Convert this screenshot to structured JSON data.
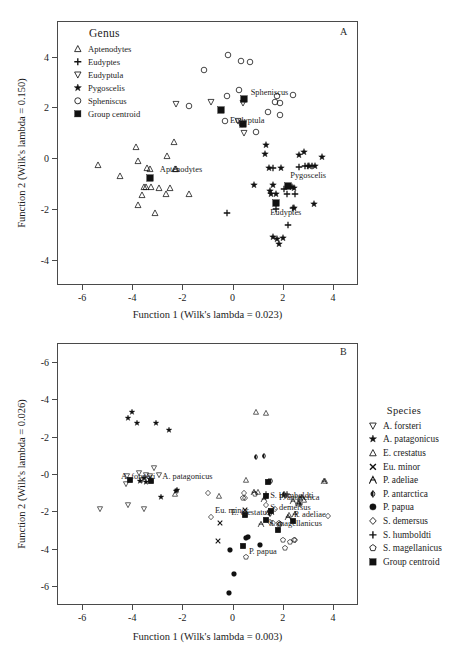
{
  "figure": {
    "panels": [
      {
        "id": "A",
        "letter": "A",
        "xlabel": "Function 1 (Wilk's lambda = 0.023)",
        "ylabel": "Function 2 (Wilk's lambda = 0.150)",
        "legend_title": "Genus"
      },
      {
        "id": "B",
        "letter": "B",
        "xlabel": "Function 1 (Wilk's lambda = 0.003)",
        "ylabel": "Function 2 (Wilk's lambda = 0.026)",
        "legend_title": "Species"
      }
    ]
  },
  "chart_data": [
    {
      "type": "scatter",
      "panel": "A",
      "title": "A",
      "xlabel": "Function 1 (Wilk's lambda = 0.023)",
      "ylabel": "Function 2 (Wilk's lambda = 0.150)",
      "xlim": [
        -7.0,
        5.0
      ],
      "ylim": [
        -5.0,
        5.4
      ],
      "xticks": [
        -6,
        -4,
        -2,
        0,
        2,
        4
      ],
      "xticklabels": [
        "-6",
        "-4",
        "-2",
        "0",
        "2",
        "4"
      ],
      "yticks": [
        -4,
        -2,
        0,
        2,
        4
      ],
      "yticklabels": [
        "-4",
        "-2",
        "0",
        "2",
        "4"
      ],
      "grid": false,
      "legend_position": "upper-left-inside",
      "legend_title": "Genus",
      "series": [
        {
          "name": "Aptenodytes",
          "marker": "triangle-up-open",
          "points": [
            [
              -5.35,
              -0.27
            ],
            [
              -4.5,
              -0.7
            ],
            [
              -3.85,
              0.42
            ],
            [
              -3.78,
              -0.1
            ],
            [
              -3.78,
              -1.86
            ],
            [
              -3.6,
              -1.44
            ],
            [
              -3.55,
              -1.12
            ],
            [
              -3.45,
              -1.12
            ],
            [
              -3.4,
              -0.4
            ],
            [
              -3.3,
              -0.42
            ],
            [
              -3.25,
              -1.15
            ],
            [
              -3.1,
              -2.17
            ],
            [
              -2.95,
              -1.18
            ],
            [
              -2.65,
              -1.4
            ],
            [
              -2.6,
              0.08
            ],
            [
              -2.5,
              -1.18
            ],
            [
              -2.35,
              0.63
            ],
            [
              -2.3,
              -0.44
            ],
            [
              -1.72,
              -1.42
            ],
            [
              -2.25,
              -0.43
            ]
          ]
        },
        {
          "name": "Eudyptes",
          "marker": "plus",
          "points": [
            [
              -0.22,
              -2.18
            ],
            [
              1.75,
              -2.02
            ],
            [
              2.2,
              -2.62
            ],
            [
              2.4,
              -1.95
            ],
            [
              2.5,
              -1.4
            ],
            [
              2.65,
              -0.35
            ],
            [
              2.9,
              -0.3
            ],
            [
              3.0,
              -0.33
            ],
            [
              3.15,
              -0.3
            ],
            [
              2.05,
              -1.22
            ],
            [
              1.62,
              -0.38
            ],
            [
              2.15,
              -1.4
            ]
          ]
        },
        {
          "name": "Eudyptula",
          "marker": "triangle-down-open",
          "points": [
            [
              -2.25,
              2.12
            ],
            [
              -0.88,
              2.22
            ],
            [
              0.42,
              2.18
            ],
            [
              0.45,
              0.98
            ],
            [
              0.4,
              1.36
            ],
            [
              0.2,
              1.48
            ]
          ]
        },
        {
          "name": "Pygoscelis",
          "marker": "star",
          "points": [
            [
              1.35,
              0.5
            ],
            [
              1.3,
              0.15
            ],
            [
              1.45,
              -0.4
            ],
            [
              1.95,
              -0.38
            ],
            [
              0.85,
              -1.06
            ],
            [
              1.6,
              -1.05
            ],
            [
              1.5,
              -1.3
            ],
            [
              1.55,
              -1.42
            ],
            [
              1.75,
              -1.42
            ],
            [
              2.45,
              -1.18
            ],
            [
              2.45,
              -1.95
            ],
            [
              3.25,
              -1.8
            ],
            [
              2.65,
              0.13
            ],
            [
              2.85,
              0.25
            ],
            [
              3.05,
              -0.3
            ],
            [
              3.3,
              -0.3
            ],
            [
              3.55,
              0.05
            ],
            [
              1.6,
              -3.12
            ],
            [
              1.78,
              -3.2
            ],
            [
              2.0,
              -3.15
            ],
            [
              1.85,
              -3.4
            ],
            [
              2.35,
              -1.15
            ]
          ]
        },
        {
          "name": "Spheniscus",
          "marker": "circle-open",
          "points": [
            [
              -1.15,
              3.48
            ],
            [
              -0.2,
              4.05
            ],
            [
              0.32,
              3.82
            ],
            [
              0.7,
              3.8
            ],
            [
              -0.22,
              2.45
            ],
            [
              0.25,
              2.68
            ],
            [
              -0.3,
              1.48
            ],
            [
              -1.72,
              2.05
            ],
            [
              0.95,
              1.03
            ],
            [
              1.4,
              1.82
            ],
            [
              1.9,
              2.18
            ],
            [
              1.9,
              1.7
            ],
            [
              1.78,
              2.45
            ],
            [
              2.4,
              2.5
            ],
            [
              0.38,
              1.33
            ],
            [
              1.7,
              2.22
            ]
          ]
        },
        {
          "name": "Group centroid",
          "marker": "square-filled",
          "points": [
            [
              -3.3,
              -0.78
            ],
            [
              0.45,
              2.32
            ],
            [
              -0.48,
              1.88
            ],
            [
              0.4,
              1.33
            ],
            [
              2.2,
              -1.1
            ],
            [
              1.72,
              -1.75
            ]
          ]
        }
      ],
      "annotations": [
        {
          "text": "Spheniscus",
          "x": 0.72,
          "y": 2.62
        },
        {
          "text": "Eudyptula",
          "x": -0.1,
          "y": 1.5
        },
        {
          "text": "Aptenodytes",
          "x": -2.9,
          "y": -0.42
        },
        {
          "text": "Pygoscelis",
          "x": 2.3,
          "y": -0.68
        },
        {
          "text": "Eudyptes",
          "x": 1.5,
          "y": -2.12
        }
      ],
      "legend_entries": [
        {
          "label": "Aptenodytes",
          "marker": "triangle-up-open"
        },
        {
          "label": "Eudyptes",
          "marker": "plus"
        },
        {
          "label": "Eudyptula",
          "marker": "triangle-down-open"
        },
        {
          "label": "Pygoscelis",
          "marker": "star"
        },
        {
          "label": "Spheniscus",
          "marker": "circle-open"
        },
        {
          "label": "Group centroid",
          "marker": "square-filled"
        }
      ]
    },
    {
      "type": "scatter",
      "panel": "B",
      "title": "B",
      "xlabel": "Function 1 (Wilk's lambda = 0.003)",
      "ylabel": "Function 2 (Wilk's lambda = 0.026)",
      "xlim": [
        -7.0,
        5.0
      ],
      "ylim": [
        -7.0,
        7.0
      ],
      "xticks": [
        -6,
        -4,
        -2,
        0,
        2,
        4
      ],
      "xticklabels": [
        "-6",
        "-4",
        "-2",
        "0",
        "2",
        "4"
      ],
      "yticks": [
        6,
        4,
        2,
        0,
        -2,
        -4,
        -6
      ],
      "yticklabels": [
        "-6",
        "-4",
        "-2",
        "-0",
        "-2",
        "-4",
        "-6"
      ],
      "y_axis_note": "axis drawn inverted; printed labels read -6,-4,-2,-0,-2,-4,-6 top to bottom",
      "grid": false,
      "legend_position": "right-outside",
      "legend_title": "Species",
      "series": [
        {
          "name": "A. forsteri",
          "marker": "triangle-down-open",
          "points": [
            [
              -5.3,
              1.88
            ],
            [
              -4.25,
              0.55
            ],
            [
              -4.2,
              0.12
            ],
            [
              -4.15,
              1.68
            ],
            [
              -3.75,
              -0.05
            ],
            [
              -3.6,
              0.3
            ],
            [
              -3.45,
              0.05
            ],
            [
              -3.3,
              0.12
            ],
            [
              -3.15,
              -0.3
            ],
            [
              -2.95,
              0.08
            ],
            [
              -3.55,
              1.88
            ]
          ]
        },
        {
          "name": "A. patagonicus",
          "marker": "star",
          "points": [
            [
              -4.15,
              -3.0
            ],
            [
              -4.0,
              -3.3
            ],
            [
              -3.8,
              -2.7
            ],
            [
              -3.55,
              0.2
            ],
            [
              -3.45,
              0.45
            ],
            [
              -3.3,
              0.25
            ],
            [
              -3.05,
              -2.75
            ],
            [
              -2.85,
              1.25
            ],
            [
              -2.55,
              -2.35
            ],
            [
              -2.25,
              0.9
            ],
            [
              -2.2,
              0.88
            ],
            [
              -3.7,
              0.35
            ]
          ]
        },
        {
          "name": "E. crestatus",
          "marker": "triangle-up-open",
          "points": [
            [
              -0.55,
              1.2
            ],
            [
              -2.3,
              1.05
            ],
            [
              0.95,
              -3.3
            ],
            [
              0.55,
              0.3
            ],
            [
              1.0,
              0.95
            ],
            [
              2.25,
              2.2
            ],
            [
              2.6,
              1.55
            ],
            [
              2.7,
              1.3
            ],
            [
              3.7,
              0.35
            ],
            [
              2.85,
              1.4
            ],
            [
              1.35,
              -3.25
            ]
          ]
        },
        {
          "name": "Eu. minor",
          "marker": "cross",
          "points": [
            [
              -0.5,
              2.6
            ],
            [
              -0.6,
              3.6
            ],
            [
              0.5,
              1.95
            ]
          ]
        },
        {
          "name": "P. adeliae",
          "marker": "adeliae",
          "points": [
            [
              1.15,
              2.65
            ],
            [
              1.25,
              1.35
            ],
            [
              0.85,
              0.95
            ],
            [
              1.45,
              2.0
            ],
            [
              2.4,
              1.45
            ],
            [
              2.65,
              1.55
            ],
            [
              2.75,
              1.25
            ],
            [
              3.65,
              0.4
            ],
            [
              2.5,
              2.15
            ],
            [
              2.2,
              2.3
            ],
            [
              1.55,
              2.05
            ]
          ]
        },
        {
          "name": "P. antarctica",
          "marker": "antarctica",
          "points": [
            [
              1.5,
              2.15
            ],
            [
              1.55,
              0.4
            ],
            [
              1.45,
              0.35
            ],
            [
              0.95,
              -0.9
            ],
            [
              2.05,
              1.05
            ],
            [
              1.25,
              -0.95
            ]
          ]
        },
        {
          "name": "P. papua",
          "marker": "circle-filled",
          "points": [
            [
              -0.15,
              6.35
            ],
            [
              0.05,
              5.35
            ],
            [
              -0.1,
              4.05
            ],
            [
              0.55,
              3.4
            ],
            [
              1.1,
              3.8
            ],
            [
              0.6,
              3.35
            ]
          ]
        },
        {
          "name": "S. demersus",
          "marker": "diamond-open",
          "points": [
            [
              -0.85,
              2.28
            ],
            [
              -1.0,
              1.0
            ],
            [
              0.5,
              1.3
            ],
            [
              0.45,
              1.0
            ],
            [
              1.35,
              1.65
            ],
            [
              1.7,
              1.85
            ],
            [
              1.85,
              2.7
            ],
            [
              1.6,
              2.6
            ],
            [
              2.5,
              3.5
            ],
            [
              3.8,
              2.25
            ],
            [
              1.5,
              2.55
            ]
          ]
        },
        {
          "name": "S. humboldti",
          "marker": "plus",
          "points": [
            [
              1.35,
              1.05
            ],
            [
              2.15,
              1.05
            ],
            [
              2.7,
              1.6
            ],
            [
              2.1,
              1.2
            ]
          ]
        },
        {
          "name": "S. magellanicus",
          "marker": "pentagon-open",
          "points": [
            [
              0.4,
              1.28
            ],
            [
              0.9,
              1.05
            ],
            [
              1.85,
              2.6
            ],
            [
              2.0,
              3.5
            ],
            [
              2.1,
              3.95
            ],
            [
              2.3,
              3.65
            ],
            [
              0.55,
              4.45
            ],
            [
              1.9,
              2.65
            ],
            [
              2.45,
              3.5
            ]
          ]
        },
        {
          "name": "Group centroid",
          "marker": "square-filled",
          "points": [
            [
              -4.1,
              0.3
            ],
            [
              -3.25,
              0.35
            ],
            [
              0.4,
              3.85
            ],
            [
              1.35,
              2.45
            ],
            [
              2.4,
              2.5
            ],
            [
              1.4,
              0.45
            ],
            [
              1.35,
              1.2
            ],
            [
              1.55,
              2.0
            ],
            [
              0.5,
              2.2
            ],
            [
              1.8,
              3.0
            ]
          ]
        }
      ],
      "annotations": [
        {
          "text": "P. papua",
          "x": 0.65,
          "y": 4.1
        },
        {
          "text": "E. crestatus",
          "x": -0.05,
          "y": 2.05
        },
        {
          "text": "P. adeliae",
          "x": 2.45,
          "y": 2.15
        },
        {
          "text": "P. antarctica",
          "x": 1.85,
          "y": 1.25
        },
        {
          "text": "A. forsteri",
          "x": -4.45,
          "y": 0.1
        },
        {
          "text": "A. patagonicus",
          "x": -2.8,
          "y": 0.1
        },
        {
          "text": "S. humboldti",
          "x": 1.5,
          "y": 1.1
        },
        {
          "text": "S. demersus",
          "x": 1.5,
          "y": 1.78
        },
        {
          "text": "Eu. minor",
          "x": -0.7,
          "y": 1.95
        },
        {
          "text": "S. magellanicus",
          "x": 1.45,
          "y": 2.6
        }
      ],
      "legend_entries": [
        {
          "label": "A. forsteri",
          "marker": "triangle-down-open"
        },
        {
          "label": "A. patagonicus",
          "marker": "star"
        },
        {
          "label": "E. crestatus",
          "marker": "triangle-up-open"
        },
        {
          "label": "Eu. minor",
          "marker": "cross"
        },
        {
          "label": "P. adeliae",
          "marker": "adeliae"
        },
        {
          "label": "P. antarctica",
          "marker": "antarctica"
        },
        {
          "label": "P. papua",
          "marker": "circle-filled"
        },
        {
          "label": "S. demersus",
          "marker": "diamond-open"
        },
        {
          "label": "S. humboldti",
          "marker": "plus"
        },
        {
          "label": "S. magellanicus",
          "marker": "pentagon-open"
        },
        {
          "label": "Group centroid",
          "marker": "square-filled"
        }
      ]
    }
  ]
}
